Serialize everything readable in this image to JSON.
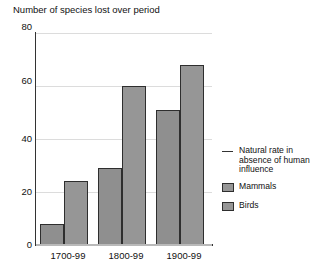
{
  "chart_data": {
    "type": "bar",
    "title": "Number of species lost over period",
    "xlabel": "",
    "ylabel": "",
    "ylim": [
      0,
      80
    ],
    "yticks": [
      0,
      20,
      40,
      60,
      80
    ],
    "ytick_labels": [
      "0",
      "20",
      "40",
      "60",
      "80"
    ],
    "grid": true,
    "legend_position": "right",
    "categories": [
      "1700-99",
      "1800-99",
      "1900-99"
    ],
    "series": [
      {
        "name": "Mammals",
        "values": [
          8,
          29,
          51
        ],
        "color": "#8f8f8f"
      },
      {
        "name": "Birds",
        "values": [
          24,
          60,
          68
        ],
        "color": "#969696"
      }
    ],
    "annotations": [
      {
        "label": "Natural rate in absence of human influence",
        "type": "reference-line",
        "value": 0,
        "color": "#b9b9b9"
      }
    ]
  },
  "title": {
    "text": "Number of species lost over period"
  },
  "yaxis": {
    "ticks": [
      {
        "label": "80",
        "value": 80
      },
      {
        "label": "60",
        "value": 60
      },
      {
        "label": "40",
        "value": 40
      },
      {
        "label": "20",
        "value": 20
      },
      {
        "label": "0",
        "value": 0
      }
    ]
  },
  "xaxis": {
    "ticks": [
      {
        "label": "1700-99"
      },
      {
        "label": "1800-99"
      },
      {
        "label": "1900-99"
      }
    ]
  },
  "bars": [
    {
      "group": "1700-99",
      "series": "Mammals",
      "value": 8
    },
    {
      "group": "1700-99",
      "series": "Birds",
      "value": 24
    },
    {
      "group": "1800-99",
      "series": "Mammals",
      "value": 29
    },
    {
      "group": "1800-99",
      "series": "Birds",
      "value": 60
    },
    {
      "group": "1900-99",
      "series": "Mammals",
      "value": 51
    },
    {
      "group": "1900-99",
      "series": "Birds",
      "value": 68
    }
  ],
  "legend": {
    "items": [
      {
        "label": "Natural rate in absence of human influence",
        "marker": "line"
      },
      {
        "label": "Mammals",
        "marker": "swatch"
      },
      {
        "label": "Birds",
        "marker": "swatch"
      }
    ]
  }
}
